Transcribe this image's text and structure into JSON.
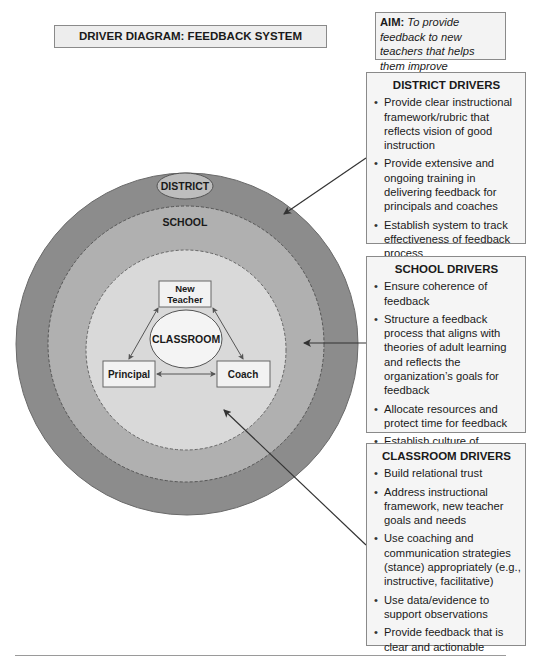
{
  "title": "DRIVER DIAGRAM: FEEDBACK SYSTEM",
  "aim": {
    "label": "AIM:",
    "text": " To provide feedback to new teachers that helps them improve instruction."
  },
  "diagram": {
    "district_label": "DISTRICT",
    "school_label": "SCHOOL",
    "classroom_label": "CLASSROOM",
    "nodes": {
      "new_teacher_line1": "New",
      "new_teacher_line2": "Teacher",
      "principal": "Principal",
      "coach": "Coach"
    },
    "colors": {
      "district_ring": "#8c8c8c",
      "school_ring": "#b0b0b0",
      "classroom_area": "#d9d9d9",
      "district_ellipse": "#bdbdbd",
      "node_fill": "#f2f2f2"
    }
  },
  "drivers": {
    "district": {
      "heading": "DISTRICT DRIVERS",
      "items": [
        "Provide clear instructional framework/rubric that reflects vision of good instruction",
        "Provide extensive and ongoing training in delivering feedback for principals and coaches",
        "Establish system to track effectiveness of feedback process"
      ]
    },
    "school": {
      "heading": "SCHOOL DRIVERS",
      "items": [
        "Ensure coherence of feedback",
        "Structure a feedback process that aligns with theories of adult learning and reflects the organization’s goals for feedback",
        "Allocate resources and protect time for feedback",
        "Establish culture of continuous learning"
      ]
    },
    "classroom": {
      "heading": "CLASSROOM DRIVERS",
      "items": [
        "Build relational trust",
        "Address instructional framework, new teacher goals and needs",
        "Use coaching and communication strategies (stance) appropriately (e.g., instructive, facilitative)",
        "Use data/evidence to support observations",
        "Provide feedback that is clear and actionable"
      ]
    }
  }
}
